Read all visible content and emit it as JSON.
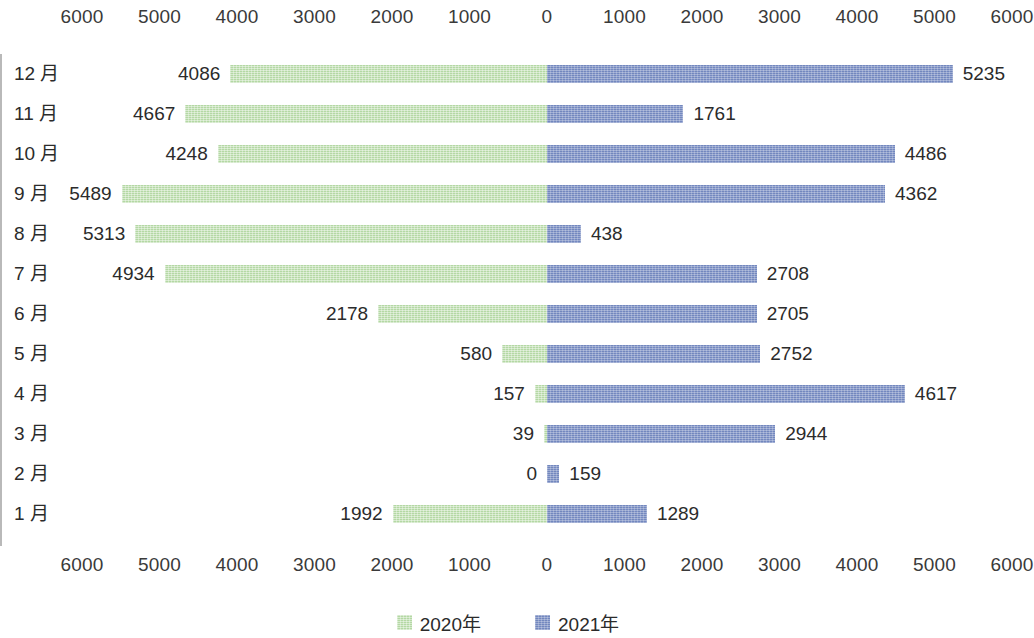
{
  "chart_data": {
    "type": "bar",
    "orientation": "horizontal",
    "style": "bidirectional-tornado",
    "title": "",
    "subtitle": "",
    "xlabel": "",
    "ylabel": "",
    "categories": [
      "12 月",
      "11 月",
      "10 月",
      "9 月",
      "8 月",
      "7 月",
      "6 月",
      "5 月",
      "4 月",
      "3 月",
      "2 月",
      "1 月"
    ],
    "series": [
      {
        "name": "2020年",
        "side": "left",
        "color": "#b4d8a4",
        "values": [
          4086,
          4667,
          4248,
          5489,
          5313,
          4934,
          2178,
          580,
          157,
          39,
          0,
          1992
        ]
      },
      {
        "name": "2021年",
        "side": "right",
        "color": "#7287bd",
        "values": [
          5235,
          1761,
          4486,
          4362,
          438,
          2708,
          2705,
          2752,
          4617,
          2944,
          159,
          1289
        ]
      }
    ],
    "axis_ticks_left": [
      "6000",
      "5000",
      "4000",
      "3000",
      "2000",
      "1000",
      "0"
    ],
    "axis_ticks_right": [
      "1000",
      "2000",
      "3000",
      "4000",
      "5000",
      "6000"
    ],
    "axis_ticks_all": [
      "6000",
      "5000",
      "4000",
      "3000",
      "2000",
      "1000",
      "0",
      "1000",
      "2000",
      "3000",
      "4000",
      "5000",
      "6000"
    ],
    "xlim": [
      0,
      6000
    ],
    "tick_step": 1000,
    "grid": false,
    "axis_positions": "top-and-bottom",
    "legend_position": "bottom-center",
    "zero_line_color": "#b9b9b9"
  },
  "legend": {
    "items": [
      {
        "label": "2020年",
        "color": "#b4d8a4"
      },
      {
        "label": "2021年",
        "color": "#7287bd"
      }
    ]
  }
}
